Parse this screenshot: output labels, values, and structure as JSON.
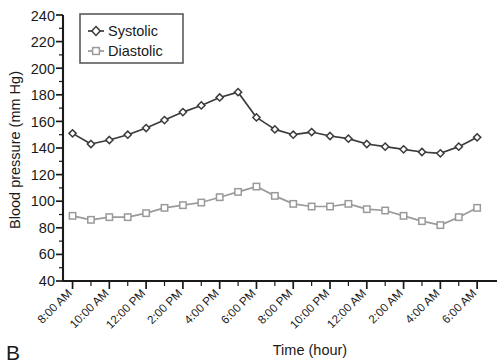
{
  "panel": {
    "label": "B"
  },
  "chart_data": {
    "type": "line",
    "title": "",
    "xlabel": "Time (hour)",
    "ylabel": "Blood pressure (mm Hg)",
    "ylim": [
      40,
      240
    ],
    "ytick_step": 20,
    "yticks": [
      40,
      60,
      80,
      100,
      120,
      140,
      160,
      180,
      200,
      220,
      240
    ],
    "grid": false,
    "legend_position": "top-left-inside",
    "x": [
      "8:00 AM",
      "9:00 AM",
      "10:00 AM",
      "11:00 AM",
      "12:00 PM",
      "1:00 PM",
      "2:00 PM",
      "3:00 PM",
      "4:00 PM",
      "5:00 PM",
      "6:00 PM",
      "7:00 PM",
      "8:00 PM",
      "9:00 PM",
      "10:00 PM",
      "11:00 PM",
      "12:00 AM",
      "1:00 AM",
      "2:00 AM",
      "3:00 AM",
      "4:00 AM",
      "5:00 AM",
      "6:00 AM"
    ],
    "xtick_labels": [
      "8:00 AM",
      "10:00 AM",
      "12:00 PM",
      "2:00 PM",
      "4:00 PM",
      "6:00 PM",
      "8:00 PM",
      "10:00 PM",
      "12:00 AM",
      "2:00 AM",
      "4:00 AM",
      "6:00 AM"
    ],
    "series": [
      {
        "name": "Systolic",
        "color": "#3b3b3b",
        "marker": "diamond",
        "values": [
          151,
          143,
          146,
          150,
          155,
          161,
          167,
          172,
          178,
          182,
          163,
          154,
          150,
          152,
          149,
          147,
          143,
          141,
          139,
          137,
          136,
          141,
          148
        ]
      },
      {
        "name": "Diastolic",
        "color": "#9a9a9a",
        "marker": "square",
        "values": [
          89,
          86,
          88,
          88,
          91,
          95,
          97,
          99,
          103,
          107,
          111,
          104,
          98,
          96,
          96,
          98,
          94,
          93,
          89,
          85,
          82,
          88,
          95
        ]
      }
    ]
  },
  "legend": {
    "items": [
      {
        "label": "Systolic"
      },
      {
        "label": "Diastolic"
      }
    ]
  }
}
